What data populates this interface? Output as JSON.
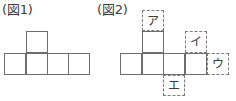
{
  "figures": [
    {
      "caption": "(図1)",
      "cells": 5,
      "shape": "row of 4 squares with 1 square on top of the 2nd square"
    },
    {
      "caption": "(図2)",
      "cells": 5,
      "shape": "row of 4 squares with 1 square on top of the 2nd square",
      "labels": [
        {
          "name": "label-a",
          "text": "ア",
          "position": "above top square"
        },
        {
          "name": "label-i",
          "text": "イ",
          "position": "above 4th square of row"
        },
        {
          "name": "label-u",
          "text": "ウ",
          "position": "right of 4th square of row"
        },
        {
          "name": "label-e",
          "text": "エ",
          "position": "below 3rd square of row"
        }
      ]
    }
  ],
  "colors": {
    "solid_line": "#6d6d6d",
    "dashed_line": "#7a7a7a",
    "text": "#3a3a3a",
    "background": "#ffffff"
  }
}
